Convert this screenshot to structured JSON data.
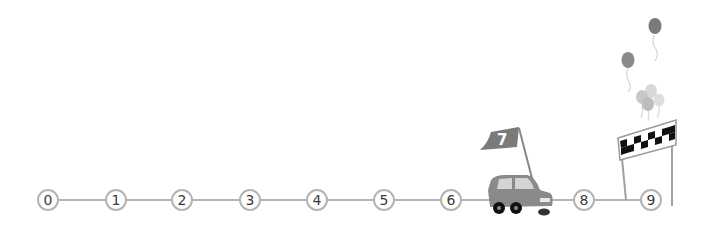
{
  "track": {
    "line_color": "#b4b4b4",
    "y": 200,
    "start_x": 48,
    "step": 67,
    "nodes": [
      {
        "label": "0",
        "x": 48
      },
      {
        "label": "1",
        "x": 116
      },
      {
        "label": "2",
        "x": 182
      },
      {
        "label": "3",
        "x": 250
      },
      {
        "label": "4",
        "x": 317
      },
      {
        "label": "5",
        "x": 384
      },
      {
        "label": "6",
        "x": 451
      },
      {
        "label": "8",
        "x": 584
      },
      {
        "label": "9",
        "x": 651
      }
    ]
  },
  "car": {
    "icon": "car-icon",
    "position": "7",
    "flag_label": "7",
    "color": "#8a8a8a"
  },
  "finish": {
    "icon": "checkered-finish-banner-icon",
    "balloons_icon": "balloons-icon"
  }
}
